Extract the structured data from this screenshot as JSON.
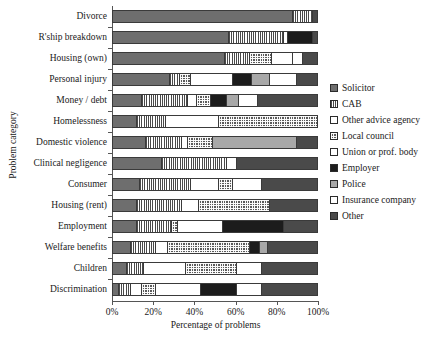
{
  "chart_data": {
    "type": "bar",
    "orientation": "horizontal",
    "stacked": true,
    "stacked_percent": true,
    "title": "",
    "xlabel": "Percentage of problems",
    "ylabel": "Problem category",
    "xlim": [
      0,
      100
    ],
    "xticks": [
      0,
      20,
      40,
      60,
      80,
      100
    ],
    "xticklabels": [
      "0%",
      "20%",
      "40%",
      "60%",
      "80%",
      "100%"
    ],
    "grid": false,
    "legend_position": "right",
    "categories": [
      "Divorce",
      "R'ship breakdown",
      "Housing (own)",
      "Personal injury",
      "Money / debt",
      "Homelessness",
      "Domestic violence",
      "Clinical negligence",
      "Consumer",
      "Housing (rent)",
      "Employment",
      "Welfare benefits",
      "Children",
      "Discrimination"
    ],
    "series": [
      {
        "name": "Solicitor",
        "key": "solicitor",
        "color": "#6e6e6e",
        "pattern": "solid-gray",
        "values": [
          88,
          57,
          55,
          28,
          14,
          12,
          16,
          24,
          13,
          12,
          12,
          9,
          7,
          3
        ]
      },
      {
        "name": "CAB",
        "key": "cab",
        "color": "#4a4a4a",
        "pattern": "vertical-lines",
        "values": [
          10,
          27,
          12,
          5,
          23,
          14,
          18,
          32,
          25,
          22,
          17,
          12,
          8,
          6
        ]
      },
      {
        "name": "Other advice agency",
        "key": "other_advice_agency",
        "color": "#ffffff",
        "pattern": "white",
        "values": [
          0,
          2,
          0,
          0,
          4,
          26,
          3,
          5,
          14,
          8,
          0,
          6,
          21,
          5
        ]
      },
      {
        "name": "Local council",
        "key": "local_council",
        "color": "#5a5a5a",
        "pattern": "cross-dot",
        "values": [
          0,
          0,
          11,
          5,
          7,
          48,
          12,
          0,
          7,
          35,
          3,
          40,
          25,
          7
        ]
      },
      {
        "name": "Union or prof. body",
        "key": "union_or_prof_body",
        "color": "#3f3f3f",
        "pattern": "horizontal-lines",
        "values": [
          0,
          0,
          10,
          21,
          0,
          0,
          0,
          0,
          0,
          0,
          22,
          0,
          0,
          22
        ]
      },
      {
        "name": "Employer",
        "key": "employer",
        "color": "#1c1c1c",
        "pattern": "solid-black",
        "values": [
          0,
          12,
          0,
          9,
          8,
          0,
          0,
          0,
          0,
          0,
          30,
          5,
          0,
          18
        ]
      },
      {
        "name": "Police",
        "key": "police",
        "color": "#a8a8a8",
        "pattern": "light-gray",
        "values": [
          0,
          0,
          0,
          9,
          6,
          0,
          41,
          0,
          0,
          0,
          0,
          4,
          0,
          0
        ]
      },
      {
        "name": "Insurance company",
        "key": "insurance_company",
        "color": "#ebebeb",
        "pattern": "very-light",
        "values": [
          0,
          0,
          5,
          13,
          9,
          0,
          0,
          0,
          14,
          0,
          0,
          0,
          12,
          12
        ]
      },
      {
        "name": "Other",
        "key": "other",
        "color": "#4a4a4a",
        "pattern": "dark-gray",
        "values": [
          2,
          2,
          7,
          10,
          29,
          0,
          10,
          39,
          27,
          23,
          16,
          24,
          27,
          27
        ]
      }
    ],
    "legend_entries": [
      "Solicitor",
      "CAB",
      "Other advice agency",
      "Local council",
      "Union or prof. body",
      "Employer",
      "Police",
      "Insurance company",
      "Other"
    ]
  }
}
